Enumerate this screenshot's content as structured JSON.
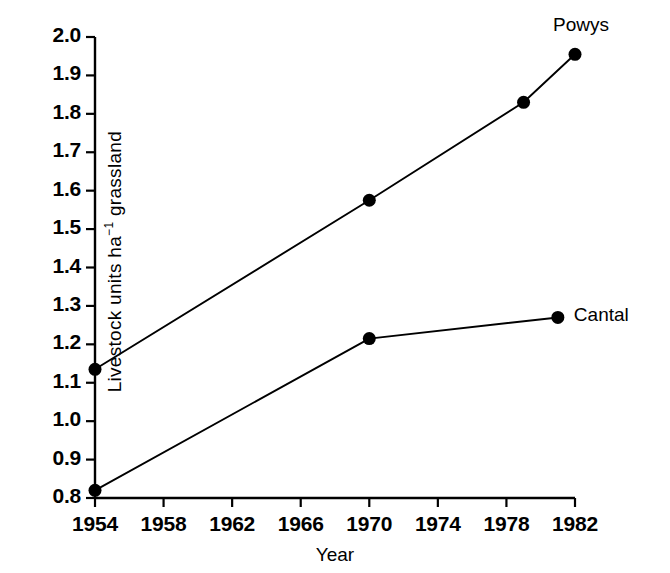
{
  "chart_data": {
    "type": "line",
    "title": "",
    "xlabel": "Year",
    "ylabel_plain": "Livestock units ha-1 grassland",
    "ylabel_parts": {
      "pre": "Livestock units ha",
      "sup": "−1",
      "post": " grassland"
    },
    "xlim": [
      1954,
      1982
    ],
    "ylim": [
      0.8,
      2.0
    ],
    "xticks": [
      1954,
      1958,
      1962,
      1966,
      1970,
      1974,
      1978,
      1982
    ],
    "xtick_labels": [
      "1954",
      "1958",
      "1962",
      "1966",
      "1970",
      "1974",
      "1978",
      "1982"
    ],
    "yticks": [
      0.8,
      0.9,
      1.0,
      1.1,
      1.2,
      1.3,
      1.4,
      1.5,
      1.6,
      1.7,
      1.8,
      1.9,
      2.0
    ],
    "ytick_labels": [
      "0.8",
      "0.9",
      "1.0",
      "1.1",
      "1.2",
      "1.3",
      "1.4",
      "1.5",
      "1.6",
      "1.7",
      "1.8",
      "1.9",
      "2.0"
    ],
    "grid": false,
    "legend_position": "inline-right-of-last-point",
    "marker": "filled-circle",
    "line_color": "#000000",
    "marker_color": "#000000",
    "background_color": "#ffffff",
    "series": [
      {
        "name": "Powys",
        "label": "Powys",
        "x": [
          1954,
          1970,
          1979,
          1982
        ],
        "values": [
          1.135,
          1.575,
          1.83,
          1.955
        ],
        "points": [
          {
            "x": 1954,
            "y": 1.135
          },
          {
            "x": 1970,
            "y": 1.575
          },
          {
            "x": 1979,
            "y": 1.83
          },
          {
            "x": 1982,
            "y": 1.955
          }
        ]
      },
      {
        "name": "Cantal",
        "label": "Cantal",
        "x": [
          1954,
          1970,
          1981
        ],
        "values": [
          0.82,
          1.215,
          1.27
        ],
        "points": [
          {
            "x": 1954,
            "y": 0.82
          },
          {
            "x": 1970,
            "y": 1.215
          },
          {
            "x": 1981,
            "y": 1.27
          }
        ]
      }
    ],
    "annotations": [
      {
        "text": "Powys",
        "for_series": "Powys"
      },
      {
        "text": "Cantal",
        "for_series": "Cantal"
      }
    ]
  }
}
